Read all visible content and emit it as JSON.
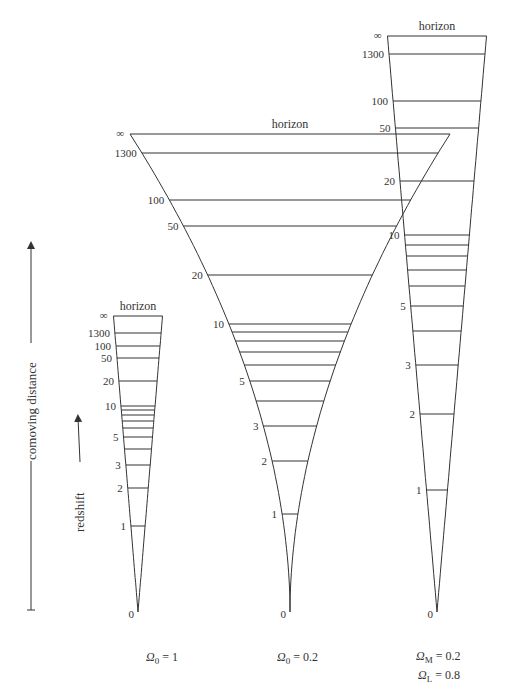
{
  "axis": {
    "comoving_label": "comoving distance",
    "redshift_label": "redshift"
  },
  "cones": [
    {
      "id": "omega1",
      "caption": {
        "symbol": "Ω",
        "sub": "0",
        "text": " = 1"
      },
      "horizon_label": "horizon",
      "infinity_label": "∞",
      "apex": [
        138,
        612
      ],
      "top_y": 316,
      "top_half_width": 24.5,
      "shape": "straight",
      "ticks": [
        {
          "z": "1300",
          "y": 333
        },
        {
          "z": "100",
          "y": 346
        },
        {
          "z": "50",
          "y": 358
        },
        {
          "z": "20",
          "y": 381
        },
        {
          "z": "10",
          "y": 406
        },
        {
          "z": "",
          "y": 410
        },
        {
          "z": "",
          "y": 415
        },
        {
          "z": "",
          "y": 421
        },
        {
          "z": "",
          "y": 428
        },
        {
          "z": "5",
          "y": 437
        },
        {
          "z": "",
          "y": 449
        },
        {
          "z": "3",
          "y": 465
        },
        {
          "z": "2",
          "y": 488
        },
        {
          "z": "1",
          "y": 526
        },
        {
          "z": "0",
          "y": 612
        }
      ]
    },
    {
      "id": "omega02",
      "caption": {
        "symbol": "Ω",
        "sub": "0",
        "text": " = 0.2"
      },
      "horizon_label": "horizon",
      "infinity_label": "∞",
      "apex": [
        290,
        612
      ],
      "top_y": 134,
      "top_half_width": 160,
      "shape": "curved",
      "ticks": [
        {
          "z": "1300",
          "y": 153
        },
        {
          "z": "100",
          "y": 200
        },
        {
          "z": "50",
          "y": 226
        },
        {
          "z": "20",
          "y": 275
        },
        {
          "z": "10",
          "y": 324
        },
        {
          "z": "",
          "y": 332
        },
        {
          "z": "",
          "y": 341
        },
        {
          "z": "",
          "y": 352
        },
        {
          "z": "",
          "y": 365
        },
        {
          "z": "5",
          "y": 381
        },
        {
          "z": "",
          "y": 401
        },
        {
          "z": "3",
          "y": 426
        },
        {
          "z": "2",
          "y": 461
        },
        {
          "z": "1",
          "y": 514
        },
        {
          "z": "0",
          "y": 612
        }
      ]
    },
    {
      "id": "lambda",
      "caption": {
        "symbol": "Ω",
        "sub": "M",
        "text": " = 0.2",
        "symbol2": "Ω",
        "sub2": "L",
        "text2": " = 0.8"
      },
      "horizon_label": "horizon",
      "infinity_label": "∞",
      "apex": [
        437,
        612
      ],
      "top_y": 36,
      "top_half_width": 49.5,
      "shape": "straight",
      "ticks": [
        {
          "z": "1300",
          "y": 54
        },
        {
          "z": "100",
          "y": 101
        },
        {
          "z": "50",
          "y": 128
        },
        {
          "z": "20",
          "y": 181
        },
        {
          "z": "10",
          "y": 235
        },
        {
          "z": "",
          "y": 245
        },
        {
          "z": "",
          "y": 256
        },
        {
          "z": "",
          "y": 270
        },
        {
          "z": "",
          "y": 286
        },
        {
          "z": "5",
          "y": 306
        },
        {
          "z": "",
          "y": 331
        },
        {
          "z": "3",
          "y": 365
        },
        {
          "z": "2",
          "y": 414
        },
        {
          "z": "1",
          "y": 490
        },
        {
          "z": "0",
          "y": 612
        }
      ]
    }
  ]
}
